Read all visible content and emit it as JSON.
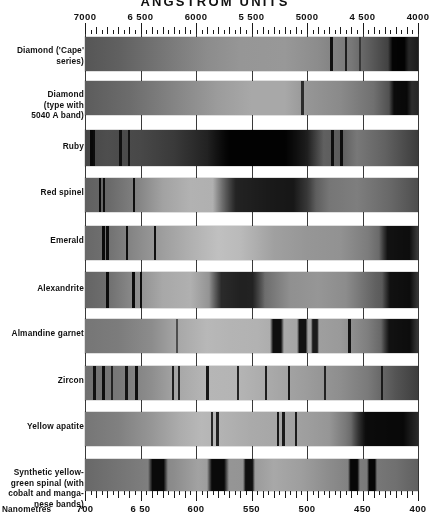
{
  "title": "ANGSTROM UNITS",
  "bottom_axis_name": "Nanometres",
  "chart_data": {
    "type": "heatmap",
    "title": "ANGSTROM UNITS",
    "subtitle": "Absorption spectra of gemstones",
    "xlabel": "Angstrom units",
    "ylabel": "",
    "xlim": [
      7000,
      4000
    ],
    "x_axis_top": {
      "unit": "Angstrom",
      "ticks": [
        7000,
        6500,
        6000,
        5500,
        5000,
        4500,
        4000
      ],
      "tick_labels": [
        "7000",
        "6 500",
        "6000",
        "5 500",
        "5000",
        "4 500",
        "4000"
      ],
      "minor_tick_step": 50,
      "mid_tick_step": 100
    },
    "x_axis_bottom": {
      "unit": "Nanometres",
      "label": "Nanometres",
      "ticks": [
        700,
        650,
        600,
        550,
        500,
        450,
        400
      ],
      "tick_labels": [
        "700",
        "6 50",
        "600",
        "550",
        "500",
        "450",
        "400"
      ],
      "minor_tick_step": 5,
      "mid_tick_step": 10
    },
    "grid": true,
    "legend": "none",
    "colormap": "grayscale-spectrum",
    "categories": [
      "Diamond ('Cape' series)",
      "Diamond (type with 5040 A band)",
      "Ruby",
      "Red spinel",
      "Emerald",
      "Alexandrite",
      "Almandine garnet",
      "Zircon",
      "Yellow apatite",
      "Synthetic yellow-green spinel (with cobalt and manganese bands)"
    ],
    "series": [
      {
        "name": "Diamond ('Cape' series)",
        "absorption_lines_angstrom": [
          4780,
          4650,
          4520,
          4350
        ],
        "broad_bands_angstrom": [
          [
            4000,
            4250
          ]
        ],
        "note": "continuum brightens to mid-spectrum, strong cut-off in violet"
      },
      {
        "name": "Diamond (type with 5040 A band)",
        "absorption_lines_angstrom": [
          5040
        ],
        "broad_bands_angstrom": [
          [
            4000,
            4300
          ]
        ],
        "note": "single 5040 A band, darkening to violet"
      },
      {
        "name": "Ruby",
        "absorption_lines_angstrom": [
          6942,
          6920,
          6680,
          6600,
          4760,
          4680
        ],
        "broad_bands_angstrom": [
          [
            5000,
            5900
          ]
        ],
        "note": "chromium doublet in red, broad green absorption, blue transmission"
      },
      {
        "name": "Red spinel",
        "absorption_lines_angstrom": [
          6860,
          6840,
          6560
        ],
        "broad_bands_angstrom": [
          [
            4900,
            5850
          ]
        ],
        "note": "fluorescent doublet, broad green band"
      },
      {
        "name": "Emerald",
        "absorption_lines_angstrom": [
          6830,
          6800,
          6620,
          6370
        ],
        "broad_bands_angstrom": [
          [
            4000,
            4400
          ]
        ],
        "note": "chromium lines in red, violet cut-off"
      },
      {
        "name": "Alexandrite",
        "absorption_lines_angstrom": [
          6800,
          6550,
          6490
        ],
        "broad_bands_angstrom": [
          [
            5400,
            5900
          ],
          [
            4000,
            4400
          ]
        ],
        "note": "chromium lines plus broad yellow-green absorption"
      },
      {
        "name": "Almandine garnet",
        "absorption_lines_angstrom": [
          6170,
          4620
        ],
        "broad_bands_angstrom": [
          [
            5230,
            5320
          ],
          [
            4930,
            5080
          ],
          [
            4000,
            4400
          ]
        ],
        "note": "three strong iron bands"
      },
      {
        "name": "Zircon",
        "absorption_lines_angstrom": [
          6910,
          6835,
          6625,
          6535,
          6210,
          6150,
          5895,
          5625,
          5370,
          5160,
          4840,
          4327
        ],
        "broad_bands_angstrom": [],
        "note": "multiple sharp rare-earth (uranium) lines"
      },
      {
        "name": "Yellow apatite",
        "absorption_lines_angstrom": [
          5850,
          5800,
          5260,
          5210,
          5100
        ],
        "broad_bands_angstrom": [
          [
            4000,
            4600
          ]
        ],
        "note": "didymium doublets in yellow and green"
      },
      {
        "name": "Synthetic yellow-green spinal (with cobalt and manganese bands)",
        "absorption_lines_angstrom": [],
        "broad_bands_angstrom": [
          [
            6250,
            6430
          ],
          [
            5700,
            5900
          ],
          [
            5470,
            5580
          ],
          [
            4520,
            4630
          ],
          [
            4370,
            4450
          ]
        ],
        "note": "manganese bands in red-yellow, cobalt bands in blue"
      }
    ]
  },
  "rows": [
    {
      "label": "Diamond ('Cape'\nseries)"
    },
    {
      "label": "Diamond\n(type with\n5040 A band)"
    },
    {
      "label": "Ruby"
    },
    {
      "label": "Red spinel"
    },
    {
      "label": "Emerald"
    },
    {
      "label": "Alexandrite"
    },
    {
      "label": "Almandine garnet"
    },
    {
      "label": "Zircon"
    },
    {
      "label": "Yellow apatite"
    },
    {
      "label": "Synthetic  yellow-\ngreen spinal (with\ncobalt and manga-\nnese bands)"
    }
  ]
}
